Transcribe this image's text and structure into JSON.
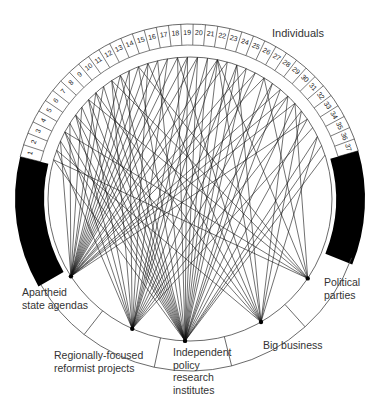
{
  "diagram": {
    "title": "Individuals",
    "individuals": [
      "1",
      "2",
      "3",
      "4",
      "5",
      "6",
      "7",
      "8",
      "9",
      "10",
      "11",
      "12",
      "13",
      "14",
      "15",
      "16",
      "17",
      "18",
      "19",
      "20",
      "21",
      "22",
      "23",
      "24",
      "25",
      "26",
      "27",
      "28",
      "29",
      "30",
      "31",
      "32",
      "33",
      "34",
      "35",
      "36",
      "37"
    ],
    "categories": [
      {
        "id": "apartheid",
        "label_lines": [
          "Apartheid",
          "state agendas"
        ]
      },
      {
        "id": "regional",
        "label_lines": [
          "Regionally-focused",
          "reformist projects"
        ]
      },
      {
        "id": "policy",
        "label_lines": [
          "Independent",
          "policy",
          "research",
          "institutes"
        ]
      },
      {
        "id": "business",
        "label_lines": [
          "Big business"
        ]
      },
      {
        "id": "parties",
        "label_lines": [
          "Political",
          "parties"
        ]
      }
    ],
    "colors": {
      "line": "#111111",
      "fill": "#000000",
      "ring": "#444444"
    }
  },
  "labels": {
    "individuals": "Individuals",
    "apartheid_1": "Apartheid",
    "apartheid_2": "state agendas",
    "regional_1": "Regionally-focused",
    "regional_2": "reformist projects",
    "policy_1": "Independent",
    "policy_2": "policy",
    "policy_3": "research",
    "policy_4": "institutes",
    "business": "Big business",
    "parties_1": "Political",
    "parties_2": "parties"
  },
  "connections": {
    "apartheid": [
      3,
      5,
      7,
      9,
      10,
      12,
      13,
      14,
      15,
      16,
      17,
      18,
      19,
      20,
      22,
      23,
      25,
      26,
      27,
      29,
      30,
      31,
      33
    ],
    "regional": [
      2,
      4,
      6,
      8,
      11,
      13,
      15,
      17,
      19,
      20,
      21,
      22,
      24,
      26,
      28,
      30,
      32,
      34
    ],
    "policy": [
      1,
      3,
      4,
      5,
      6,
      7,
      8,
      9,
      10,
      11,
      12,
      14,
      16,
      18,
      19,
      20,
      21,
      22,
      23,
      24,
      25,
      27,
      28,
      29,
      31,
      33,
      35,
      36,
      37
    ],
    "business": [
      2,
      6,
      9,
      12,
      15,
      18,
      22,
      24,
      30,
      32,
      35
    ],
    "parties": [
      1,
      4,
      8,
      11,
      14,
      22,
      27,
      31
    ]
  }
}
